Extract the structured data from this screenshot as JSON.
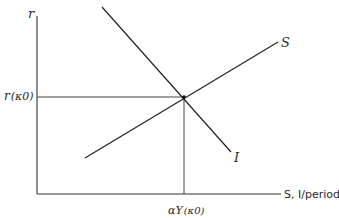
{
  "diagram": {
    "type": "savings-investment equilibrium",
    "axes": {
      "y_label": "r",
      "x_label": "S, I/period"
    },
    "curves": [
      {
        "name": "S",
        "label": "S",
        "slope": "upward"
      },
      {
        "name": "I",
        "label": "I",
        "slope": "downward"
      }
    ],
    "equilibrium": {
      "y_label_main": "r",
      "y_label_paren": "(κ0)",
      "x_label_main": "αY",
      "x_label_paren": "(κ0)"
    },
    "colors": {
      "line": "#222222",
      "background": "#ffffff"
    }
  }
}
